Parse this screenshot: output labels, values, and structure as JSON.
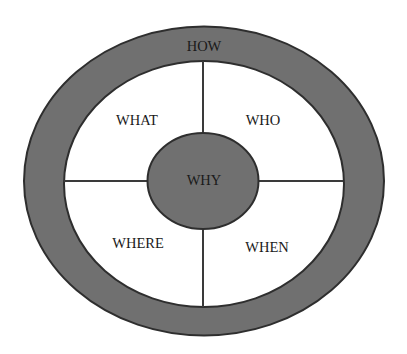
{
  "diagram": {
    "type": "concentric-quadrant",
    "colors": {
      "ring_fill": "#707070",
      "stroke": "#2e2e2e",
      "inner_fill": "#ffffff",
      "text": "#1a1a1a"
    },
    "outer_ring": {
      "label": "HOW"
    },
    "center": {
      "label": "WHY"
    },
    "quadrants": [
      {
        "position": "top-left",
        "label": "WHAT"
      },
      {
        "position": "top-right",
        "label": "WHO"
      },
      {
        "position": "bottom-left",
        "label": "WHERE"
      },
      {
        "position": "bottom-right",
        "label": "WHEN"
      }
    ]
  }
}
